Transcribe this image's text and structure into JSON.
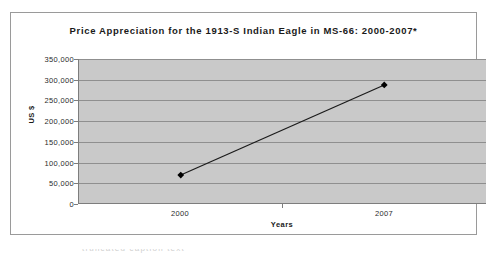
{
  "chart_data": {
    "type": "line",
    "title": "Price Appreciation for the 1913-S Indian Eagle in MS-66: 2000-2007*",
    "xlabel": "Years",
    "ylabel": "US $",
    "categories": [
      "2000",
      "2007"
    ],
    "values": [
      68000,
      287000
    ],
    "series": [
      {
        "name": "Price",
        "values": [
          68000,
          287000
        ]
      }
    ],
    "ylim": [
      0,
      350000
    ],
    "yticks": [
      0,
      50000,
      100000,
      150000,
      200000,
      250000,
      300000,
      350000
    ],
    "ytick_labels": [
      "0",
      "50,000",
      "100,000",
      "150,000",
      "200,000",
      "250,000",
      "300,000",
      "350,000"
    ],
    "xtick_labels": [
      "2000",
      "2007"
    ],
    "grid": true,
    "legend": false,
    "marker": "diamond",
    "line_color": "#1a1a1a",
    "marker_color": "#000000",
    "plot_background": "#c9c9c9",
    "gridline_color": "#8f8f8f",
    "axis_color": "#7d7d7d"
  },
  "footnote": {
    "text": "truncated caption text"
  }
}
